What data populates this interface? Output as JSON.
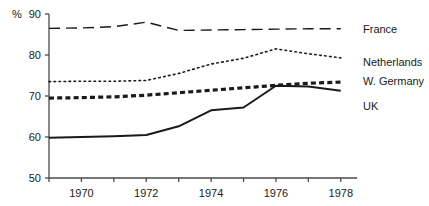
{
  "chart_data": {
    "type": "line",
    "title": "",
    "subtitle": "",
    "xlabel": "",
    "ylabel": "%",
    "unit_symbol": "%",
    "xlim": [
      1969,
      1978.5
    ],
    "ylim": [
      50,
      90
    ],
    "yticks": [
      50,
      60,
      70,
      80,
      90
    ],
    "ytick_labels": [
      "50",
      "60",
      "70",
      "80",
      "90"
    ],
    "xticks": [
      1969,
      1970,
      1971,
      1972,
      1973,
      1974,
      1975,
      1976,
      1977,
      1978
    ],
    "xtick_labels": [
      "",
      "1970",
      "",
      "1972",
      "",
      "1974",
      "",
      "1976",
      "",
      "1978"
    ],
    "xtick_labels_shown": [
      "1970",
      "1972",
      "1974",
      "1976",
      "1978"
    ],
    "grid": false,
    "legend_position": "right-inline",
    "x": [
      1969,
      1970,
      1971,
      1972,
      1973,
      1974,
      1975,
      1976,
      1977,
      1978
    ],
    "series": [
      {
        "name": "France",
        "style": "long-dashed",
        "color": "#1a1a1a",
        "width": 1.4,
        "values": [
          86.5,
          86.6,
          86.9,
          88.0,
          86.0,
          86.1,
          86.2,
          86.3,
          86.4,
          86.4
        ]
      },
      {
        "name": "Netherlands",
        "style": "dotted",
        "color": "#1a1a1a",
        "width": 1.6,
        "values": [
          73.5,
          73.6,
          73.6,
          73.8,
          75.5,
          77.8,
          79.2,
          81.5,
          80.3,
          79.3
        ]
      },
      {
        "name": "W. Germany",
        "style": "thick-dashed",
        "color": "#1a1a1a",
        "width": 3.2,
        "values": [
          69.5,
          69.6,
          69.8,
          70.2,
          70.8,
          71.4,
          72.0,
          72.6,
          73.1,
          73.4
        ]
      },
      {
        "name": "UK",
        "style": "solid",
        "color": "#1a1a1a",
        "width": 2.0,
        "values": [
          59.8,
          60.0,
          60.2,
          60.5,
          62.6,
          66.5,
          67.2,
          72.5,
          72.3,
          71.3
        ]
      }
    ]
  },
  "legend": {
    "entries": [
      {
        "label": "France"
      },
      {
        "label": "Netherlands"
      },
      {
        "label": "W. Germany"
      },
      {
        "label": "UK"
      }
    ]
  }
}
